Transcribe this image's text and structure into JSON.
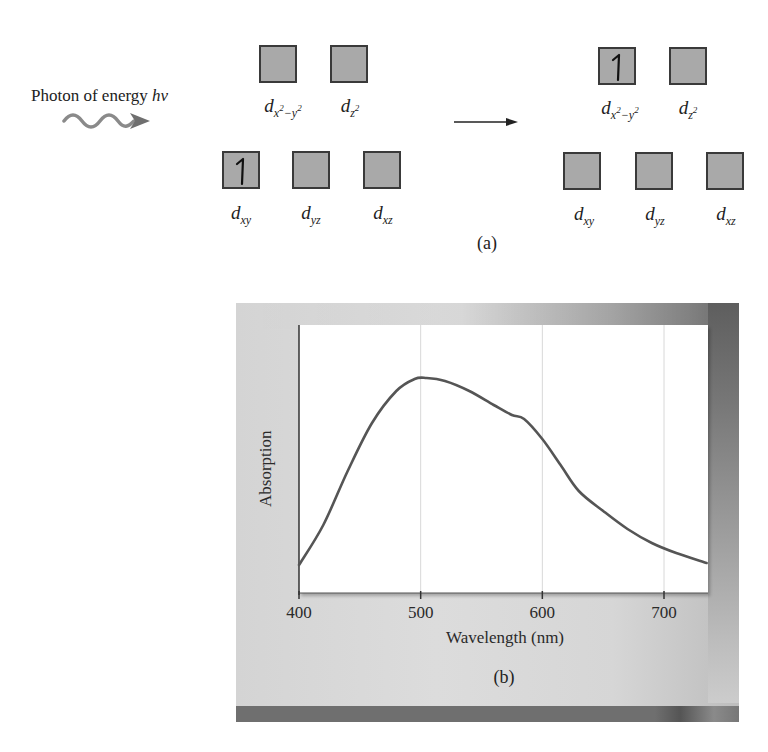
{
  "panel_a": {
    "photon_label_prefix": "Photon of energy ",
    "photon_label_symbol": "hv",
    "caption": "(a)",
    "before": {
      "upper": [
        {
          "name": "d",
          "subscript_base": "x",
          "subscript_sup1": "2",
          "subscript_mid": "−y",
          "subscript_sup2": "2",
          "electrons": 0
        },
        {
          "name": "d",
          "subscript_base": "z",
          "subscript_sup1": "2",
          "electrons": 0
        }
      ],
      "lower": [
        {
          "name": "d",
          "subscript": "xy",
          "electrons": 1
        },
        {
          "name": "d",
          "subscript": "yz",
          "electrons": 0
        },
        {
          "name": "d",
          "subscript": "xz",
          "electrons": 0
        }
      ]
    },
    "after": {
      "upper": [
        {
          "name": "d",
          "subscript_base": "x",
          "subscript_sup1": "2",
          "subscript_mid": "−y",
          "subscript_sup2": "2",
          "electrons": 1
        },
        {
          "name": "d",
          "subscript_base": "z",
          "subscript_sup1": "2",
          "electrons": 0
        }
      ],
      "lower": [
        {
          "name": "d",
          "subscript": "xy",
          "electrons": 0
        },
        {
          "name": "d",
          "subscript": "yz",
          "electrons": 0
        },
        {
          "name": "d",
          "subscript": "xz",
          "electrons": 0
        }
      ]
    },
    "colors": {
      "box_fill": "#a9a9a9",
      "box_border": "#3a3a3a",
      "arrow": "#777777"
    }
  },
  "panel_b": {
    "caption": "(b)",
    "colors": {
      "curve": "#555555",
      "frame": "#d6d6d6",
      "bar": "#6f6f6f"
    }
  },
  "chart_data": {
    "type": "line",
    "title": "",
    "xlabel": "Wavelength (nm)",
    "ylabel": "Absorption",
    "xlim": [
      400,
      735
    ],
    "ylim": [
      0,
      1
    ],
    "xticks": [
      400,
      500,
      600,
      700
    ],
    "xtick_labels": [
      "400",
      "500",
      "600",
      "700"
    ],
    "grid": {
      "vertical": true,
      "horizontal": false
    },
    "yticks_shown": false,
    "series": [
      {
        "name": "Absorption spectrum",
        "x": [
          400,
          420,
          440,
          460,
          480,
          495,
          505,
          520,
          540,
          560,
          575,
          585,
          600,
          615,
          630,
          650,
          670,
          690,
          710,
          735
        ],
        "y": [
          0.05,
          0.25,
          0.52,
          0.76,
          0.92,
          0.98,
          0.985,
          0.97,
          0.92,
          0.85,
          0.8,
          0.78,
          0.68,
          0.55,
          0.42,
          0.32,
          0.23,
          0.16,
          0.11,
          0.06
        ]
      }
    ]
  }
}
